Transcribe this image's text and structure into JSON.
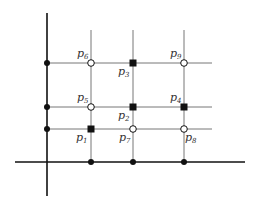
{
  "diagram": {
    "title": "",
    "colors": {
      "axis": "#111111",
      "grid": "#777777",
      "marker": "#111111",
      "background": "#ffffff",
      "label": "#333333"
    },
    "axes": {
      "vertical": {
        "x": 47,
        "y1": 13,
        "y2": 196
      },
      "horizontal": {
        "y": 162,
        "x1": 15,
        "x2": 245
      }
    },
    "grid": {
      "columns": [
        91,
        133,
        184
      ],
      "rows": [
        63,
        107,
        129
      ],
      "vline_top": 30,
      "hline_right": 212
    },
    "axis_ticks": [
      {
        "x": 47,
        "y": 63
      },
      {
        "x": 47,
        "y": 107
      },
      {
        "x": 47,
        "y": 129
      },
      {
        "x": 91,
        "y": 162
      },
      {
        "x": 133,
        "y": 162
      },
      {
        "x": 184,
        "y": 162
      }
    ],
    "points": [
      {
        "name": "p1",
        "base": "p",
        "sub": "1",
        "x": 91,
        "y": 129,
        "marker": "filled-square",
        "lx": 76,
        "ly": 141
      },
      {
        "name": "p2",
        "base": "p",
        "sub": "2",
        "x": 133,
        "y": 107,
        "marker": "filled-square",
        "lx": 118,
        "ly": 119
      },
      {
        "name": "p3",
        "base": "p",
        "sub": "3",
        "x": 133,
        "y": 63,
        "marker": "filled-square",
        "lx": 118,
        "ly": 75
      },
      {
        "name": "p4",
        "base": "p",
        "sub": "4",
        "x": 184,
        "y": 107,
        "marker": "filled-square",
        "lx": 170,
        "ly": 101
      },
      {
        "name": "p5",
        "base": "p",
        "sub": "5",
        "x": 91,
        "y": 107,
        "marker": "open-circle",
        "lx": 77,
        "ly": 101
      },
      {
        "name": "p6",
        "base": "p",
        "sub": "6",
        "x": 91,
        "y": 63,
        "marker": "open-circle",
        "lx": 77,
        "ly": 57
      },
      {
        "name": "p7",
        "base": "p",
        "sub": "7",
        "x": 133,
        "y": 129,
        "marker": "open-circle",
        "lx": 119,
        "ly": 141
      },
      {
        "name": "p8",
        "base": "p",
        "sub": "8",
        "x": 184,
        "y": 129,
        "marker": "open-circle",
        "lx": 185,
        "ly": 141
      },
      {
        "name": "p9",
        "base": "p",
        "sub": "9",
        "x": 184,
        "y": 63,
        "marker": "open-circle",
        "lx": 170,
        "ly": 57
      }
    ]
  }
}
